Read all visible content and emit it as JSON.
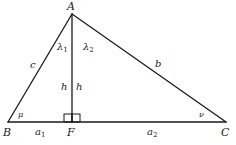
{
  "diagram": {
    "vertices": {
      "A": {
        "label": "A",
        "x": 72,
        "y": 14
      },
      "B": {
        "label": "B",
        "x": 8,
        "y": 122
      },
      "C": {
        "label": "C",
        "x": 226,
        "y": 122
      },
      "F": {
        "label": "F",
        "x": 72,
        "y": 122
      }
    },
    "sides": {
      "c": {
        "label": "c"
      },
      "b": {
        "label": "b"
      }
    },
    "segments": {
      "a1": {
        "base": "a",
        "sub": "1"
      },
      "a2": {
        "base": "a",
        "sub": "2"
      }
    },
    "altitude": {
      "left_label": "h",
      "right_label": "h"
    },
    "angles": {
      "lambda1": {
        "base": "λ",
        "sub": "1"
      },
      "lambda2": {
        "base": "λ",
        "sub": "2"
      },
      "mu": {
        "label": "μ"
      },
      "nu": {
        "label": "ν"
      }
    },
    "right_angle_marker": true,
    "colors": {
      "ink": "#1a1a1a",
      "background": "#ffffff"
    }
  }
}
